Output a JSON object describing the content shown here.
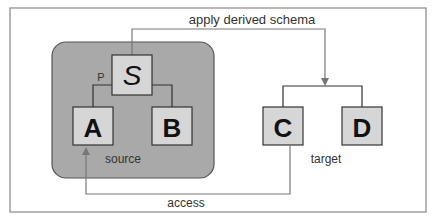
{
  "labels": {
    "top_arrow": "apply derived schema",
    "bottom_arrow": "access",
    "source": "source",
    "target": "target",
    "edge_p": "P"
  },
  "nodes": {
    "s": "S",
    "a": "A",
    "b": "B",
    "c": "C",
    "d": "D"
  },
  "colors": {
    "frame": "#888888",
    "source_bg": "#a9a9a9",
    "box_bg": "#d6d6d6",
    "line": "#555555"
  }
}
